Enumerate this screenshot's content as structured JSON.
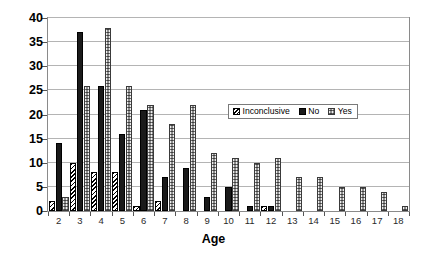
{
  "chart_data": {
    "type": "bar",
    "title": "",
    "xlabel": "Age",
    "ylabel": "",
    "ylim": [
      0,
      40
    ],
    "yticks": [
      0,
      5,
      10,
      15,
      20,
      25,
      30,
      35,
      40
    ],
    "grid": true,
    "legend_position": "inside-upper-right",
    "categories": [
      "2",
      "3",
      "4",
      "5",
      "6",
      "7",
      "8",
      "9",
      "10",
      "11",
      "12",
      "13",
      "14",
      "15",
      "16",
      "17",
      "18"
    ],
    "series": [
      {
        "name": "Inconclusive",
        "pattern": "diagonal-hatch",
        "color": "#ffffff",
        "values": [
          2,
          10,
          8,
          8,
          1,
          2,
          0,
          0,
          0,
          0,
          1,
          0,
          0,
          0,
          0,
          0,
          0
        ]
      },
      {
        "name": "No",
        "pattern": "solid",
        "color": "#1a1a1a",
        "values": [
          14,
          37,
          26,
          16,
          21,
          7,
          9,
          3,
          5,
          1,
          1,
          0,
          0,
          0,
          0,
          0,
          0
        ]
      },
      {
        "name": "Yes",
        "pattern": "gray-checker",
        "color": "#8e8e8e",
        "values": [
          3,
          26,
          38,
          26,
          22,
          18,
          22,
          12,
          11,
          10,
          11,
          7,
          7,
          5,
          5,
          4,
          1
        ]
      }
    ]
  },
  "axis": {
    "x_title": "Age",
    "y_tick_labels": [
      "0",
      "5",
      "10",
      "15",
      "20",
      "25",
      "30",
      "35",
      "40"
    ]
  },
  "legend": {
    "items": [
      {
        "label": "Inconclusive"
      },
      {
        "label": "No"
      },
      {
        "label": "Yes"
      }
    ]
  }
}
